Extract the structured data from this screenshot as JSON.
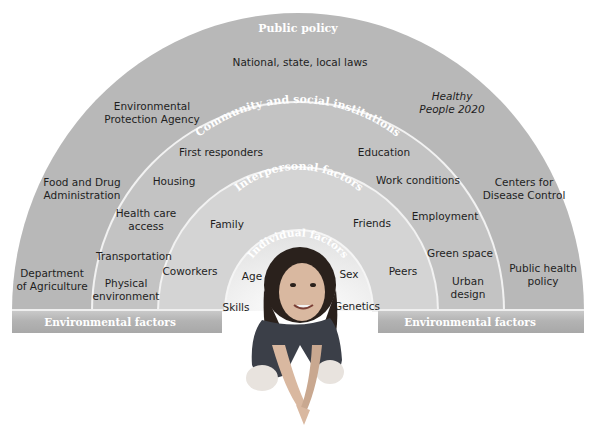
{
  "diagram": {
    "rings": [
      {
        "name": "Public policy",
        "color": "#b9b9b9",
        "items": [
          "National, state, local laws",
          "Environmental Protection Agency",
          "Healthy People 2020",
          "Food and Drug Administration",
          "Centers for Disease Control",
          "Department of Agriculture",
          "Public health policy"
        ]
      },
      {
        "name": "Community and social institutions",
        "color": "#c4c4c4",
        "items": [
          "First responders",
          "Education",
          "Housing",
          "Work conditions",
          "Health care access",
          "Employment",
          "Transportation",
          "Green space",
          "Physical environment",
          "Urban design"
        ]
      },
      {
        "name": "Interpersonal factors",
        "color": "#d6d6d6",
        "items": [
          "Family",
          "Friends",
          "Coworkers",
          "Peers"
        ]
      },
      {
        "name": "Individual factors",
        "color": "#eaeaea",
        "items": [
          "Age",
          "Sex",
          "Skills",
          "Genetics"
        ]
      }
    ],
    "base_band": {
      "left_label": "Environmental factors",
      "right_label": "Environmental factors"
    },
    "center_image": "person-kneeling-photo"
  },
  "labels": {
    "public_policy_title": "Public policy",
    "community_title": "Community and social institutions",
    "interpersonal_title": "Interpersonal factors",
    "individual_title": "Individual factors",
    "national": "National, state, local laws",
    "epa_1": "Environmental",
    "epa_2": "Protection Agency",
    "healthy_1": "Healthy",
    "healthy_2": "People 2020",
    "fda_1": "Food and Drug",
    "fda_2": "Administration",
    "cdc_1": "Centers for",
    "cdc_2": "Disease Control",
    "usda_1": "Department",
    "usda_2": "of Agriculture",
    "php_1": "Public health",
    "php_2": "policy",
    "first_responders": "First responders",
    "education": "Education",
    "housing": "Housing",
    "work_conditions": "Work conditions",
    "hca_1": "Health care",
    "hca_2": "access",
    "employment": "Employment",
    "transportation": "Transportation",
    "green_space": "Green space",
    "phys_1": "Physical",
    "phys_2": "environment",
    "urban_1": "Urban",
    "urban_2": "design",
    "family": "Family",
    "friends": "Friends",
    "coworkers": "Coworkers",
    "peers": "Peers",
    "age": "Age",
    "sex": "Sex",
    "skills": "Skills",
    "genetics": "Genetics",
    "env_left": "Environmental factors",
    "env_right": "Environmental factors"
  }
}
